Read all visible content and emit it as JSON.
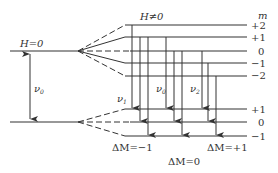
{
  "labels": {
    "h_zero": "H=0",
    "h_nonzero": "H≠0",
    "m_header": "m",
    "nu0_left": "ν",
    "nu0_left_sub": "0",
    "nu1": "ν",
    "nu1_sub": "1",
    "nu0_mid": "ν",
    "nu0_mid_sub": "0",
    "nu2": "ν",
    "nu2_sub": "2",
    "dm_minus": "ΔM=−1",
    "dm_zero": "ΔM=0",
    "dm_plus": "ΔM=+1"
  },
  "upper_levels": [
    "+2",
    "+1",
    "0",
    "−1",
    "−2"
  ],
  "lower_levels": [
    "+1",
    "0",
    "−1"
  ],
  "colors": {
    "line": "#333333",
    "text": "#333333"
  }
}
